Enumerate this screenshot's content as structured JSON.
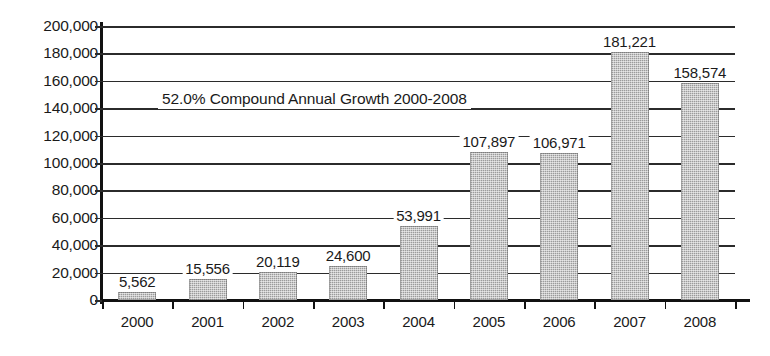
{
  "chart_data": {
    "type": "bar",
    "title": "",
    "xlabel": "",
    "ylabel": "",
    "categories": [
      "2000",
      "2001",
      "2002",
      "2003",
      "2004",
      "2005",
      "2006",
      "2007",
      "2008"
    ],
    "values": [
      5562,
      15556,
      20119,
      24600,
      53991,
      107897,
      106971,
      181221,
      158574
    ],
    "value_labels": [
      "5,562",
      "15,556",
      "20,119",
      "24,600",
      "53,991",
      "107,897",
      "106,971",
      "181,221",
      "158,574"
    ],
    "ylim": [
      0,
      200000
    ],
    "ytick_step": 20000,
    "ytick_labels": [
      "200,000",
      "180,000",
      "160,000",
      "140,000",
      "120,000",
      "100,000",
      "80,000",
      "60,000",
      "40,000",
      "20,000",
      "0"
    ],
    "ytick_values": [
      200000,
      180000,
      160000,
      140000,
      120000,
      100000,
      80000,
      60000,
      40000,
      20000,
      0
    ],
    "grid": true,
    "legend": false,
    "annotations": [
      {
        "text": "52.0% Compound Annual Growth 2000-2008"
      }
    ],
    "colors": {
      "bar_fill": "#9b9b9b",
      "axis": "#111111",
      "gridline": "#2b2b2b",
      "background": "#ffffff",
      "text": "#1a1a1a"
    }
  }
}
